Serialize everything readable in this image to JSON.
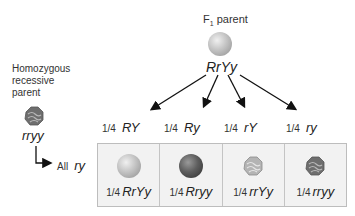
{
  "f1_parent": {
    "label_prefix": "F",
    "label_sub": "1",
    "label_suffix": " parent",
    "genotype": "RrYy",
    "phenotype_icon": "round-yellow-pea-icon"
  },
  "recessive_parent": {
    "label_line1": "Homozygous",
    "label_line2": "recessive",
    "label_line3": "parent",
    "genotype": "rryy",
    "phenotype_icon": "wrinkled-green-pea-icon",
    "gamete_label": "All",
    "gamete": "ry"
  },
  "gametes": [
    {
      "fraction": "1/4",
      "allele": "RY"
    },
    {
      "fraction": "1/4",
      "allele": "Ry"
    },
    {
      "fraction": "1/4",
      "allele": "rY"
    },
    {
      "fraction": "1/4",
      "allele": "ry"
    }
  ],
  "offspring": [
    {
      "fraction": "1/4",
      "genotype": "RrYy",
      "icon": "round-yellow-pea-icon"
    },
    {
      "fraction": "1/4",
      "genotype": "Rryy",
      "icon": "round-green-pea-icon"
    },
    {
      "fraction": "1/4",
      "genotype": "rrYy",
      "icon": "wrinkled-yellow-pea-icon"
    },
    {
      "fraction": "1/4",
      "genotype": "rryy",
      "icon": "wrinkled-green-pea-icon"
    }
  ],
  "colors": {
    "grid_bg": "#f2f2f2",
    "grid_border": "#bdbdbd",
    "arrow": "#111111"
  }
}
